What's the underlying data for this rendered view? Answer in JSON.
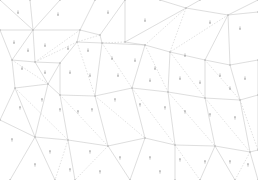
{
  "diagram": {
    "type": "triangulated-mesh-vector-field",
    "background": "#ffffff",
    "edge_color": "#c8c8c8",
    "arrow_color": "#9a9a9a",
    "vertices": [
      [
        0,
        0
      ],
      [
        30,
        0
      ],
      [
        60,
        0
      ],
      [
        95,
        0
      ],
      [
        125,
        0
      ],
      [
        160,
        0
      ],
      [
        200,
        0
      ],
      [
        258,
        0
      ],
      [
        33,
        30
      ],
      [
        80,
        30
      ],
      [
        100,
        35
      ],
      [
        125,
        42
      ],
      [
        186,
        8
      ],
      [
        228,
        15
      ],
      [
        258,
        12
      ],
      [
        0,
        30
      ],
      [
        12,
        60
      ],
      [
        35,
        62
      ],
      [
        60,
        63
      ],
      [
        77,
        42
      ],
      [
        102,
        43
      ],
      [
        145,
        45
      ],
      [
        170,
        52
      ],
      [
        205,
        60
      ],
      [
        230,
        65
      ],
      [
        258,
        60
      ],
      [
        15,
        88
      ],
      [
        48,
        84
      ],
      [
        60,
        95
      ],
      [
        95,
        96
      ],
      [
        132,
        88
      ],
      [
        168,
        92
      ],
      [
        205,
        98
      ],
      [
        240,
        100
      ],
      [
        258,
        95
      ],
      [
        0,
        120
      ],
      [
        35,
        137
      ],
      [
        68,
        140
      ],
      [
        108,
        146
      ],
      [
        145,
        138
      ],
      [
        175,
        145
      ],
      [
        215,
        146
      ],
      [
        250,
        152
      ],
      [
        258,
        150
      ],
      [
        10,
        180
      ],
      [
        55,
        180
      ],
      [
        75,
        180
      ],
      [
        130,
        180
      ],
      [
        175,
        180
      ],
      [
        200,
        180
      ],
      [
        235,
        180
      ],
      [
        258,
        180
      ]
    ],
    "edges_solid": [
      [
        0,
        8
      ],
      [
        1,
        8
      ],
      [
        8,
        2
      ],
      [
        8,
        15
      ],
      [
        8,
        16
      ],
      [
        8,
        17
      ],
      [
        9,
        3
      ],
      [
        9,
        8
      ],
      [
        9,
        19
      ],
      [
        9,
        10
      ],
      [
        10,
        4
      ],
      [
        10,
        20
      ],
      [
        11,
        4
      ],
      [
        11,
        12
      ],
      [
        11,
        21
      ],
      [
        12,
        5
      ],
      [
        12,
        6
      ],
      [
        12,
        13
      ],
      [
        13,
        7
      ],
      [
        13,
        14
      ],
      [
        13,
        23
      ],
      [
        13,
        24
      ],
      [
        15,
        16
      ],
      [
        16,
        17
      ],
      [
        17,
        18
      ],
      [
        18,
        19
      ],
      [
        19,
        20
      ],
      [
        20,
        21
      ],
      [
        21,
        22
      ],
      [
        22,
        23
      ],
      [
        23,
        24
      ],
      [
        24,
        25
      ],
      [
        16,
        26
      ],
      [
        17,
        27
      ],
      [
        18,
        27
      ],
      [
        18,
        28
      ],
      [
        20,
        29
      ],
      [
        21,
        30
      ],
      [
        22,
        31
      ],
      [
        23,
        32
      ],
      [
        24,
        33
      ],
      [
        25,
        34
      ],
      [
        26,
        27
      ],
      [
        27,
        28
      ],
      [
        28,
        29
      ],
      [
        29,
        30
      ],
      [
        30,
        31
      ],
      [
        31,
        32
      ],
      [
        32,
        33
      ],
      [
        33,
        34
      ],
      [
        26,
        35
      ],
      [
        26,
        36
      ],
      [
        27,
        36
      ],
      [
        28,
        37
      ],
      [
        29,
        38
      ],
      [
        30,
        39
      ],
      [
        31,
        40
      ],
      [
        32,
        41
      ],
      [
        33,
        42
      ],
      [
        34,
        43
      ],
      [
        35,
        36
      ],
      [
        36,
        37
      ],
      [
        37,
        38
      ],
      [
        38,
        39
      ],
      [
        39,
        40
      ],
      [
        40,
        41
      ],
      [
        41,
        42
      ],
      [
        42,
        43
      ],
      [
        36,
        44
      ],
      [
        36,
        45
      ],
      [
        37,
        46
      ],
      [
        38,
        47
      ],
      [
        39,
        47
      ],
      [
        40,
        48
      ],
      [
        41,
        49
      ],
      [
        41,
        50
      ],
      [
        42,
        51
      ]
    ],
    "edges_dashed": [
      [
        9,
        17
      ],
      [
        10,
        19
      ],
      [
        11,
        20
      ],
      [
        12,
        21
      ],
      [
        12,
        22
      ],
      [
        13,
        22
      ],
      [
        16,
        27
      ],
      [
        17,
        19
      ],
      [
        19,
        29
      ],
      [
        20,
        30
      ],
      [
        21,
        31
      ],
      [
        22,
        32
      ],
      [
        23,
        33
      ],
      [
        26,
        37
      ],
      [
        28,
        38
      ],
      [
        29,
        39
      ],
      [
        30,
        40
      ],
      [
        31,
        41
      ],
      [
        32,
        42
      ],
      [
        33,
        43
      ],
      [
        37,
        45
      ],
      [
        38,
        46
      ],
      [
        40,
        49
      ],
      [
        42,
        50
      ]
    ],
    "arrows_down": [
      [
        18,
        12
      ],
      [
        58,
        14
      ],
      [
        108,
        12
      ],
      [
        145,
        20
      ],
      [
        210,
        22
      ],
      [
        240,
        28
      ],
      [
        14,
        42
      ],
      [
        28,
        50
      ],
      [
        45,
        45
      ],
      [
        68,
        48
      ],
      [
        88,
        50
      ],
      [
        112,
        58
      ],
      [
        135,
        60
      ],
      [
        155,
        68
      ],
      [
        185,
        55
      ],
      [
        220,
        75
      ],
      [
        245,
        78
      ],
      [
        22,
        68
      ],
      [
        45,
        72
      ],
      [
        70,
        72
      ],
      [
        90,
        75
      ],
      [
        118,
        75
      ],
      [
        150,
        80
      ],
      [
        180,
        78
      ],
      [
        200,
        82
      ],
      [
        230,
        88
      ]
    ],
    "arrows_up": [
      [
        20,
        108
      ],
      [
        42,
        100
      ],
      [
        60,
        110
      ],
      [
        78,
        112
      ],
      [
        92,
        110
      ],
      [
        115,
        100
      ],
      [
        140,
        105
      ],
      [
        165,
        108
      ],
      [
        185,
        112
      ],
      [
        210,
        115
      ],
      [
        235,
        118
      ],
      [
        12,
        140
      ],
      [
        50,
        152
      ],
      [
        90,
        152
      ],
      [
        120,
        158
      ],
      [
        150,
        158
      ],
      [
        180,
        160
      ],
      [
        205,
        162
      ],
      [
        230,
        162
      ],
      [
        248,
        165
      ],
      [
        35,
        165
      ],
      [
        70,
        170
      ],
      [
        100,
        172
      ],
      [
        160,
        172
      ]
    ]
  }
}
